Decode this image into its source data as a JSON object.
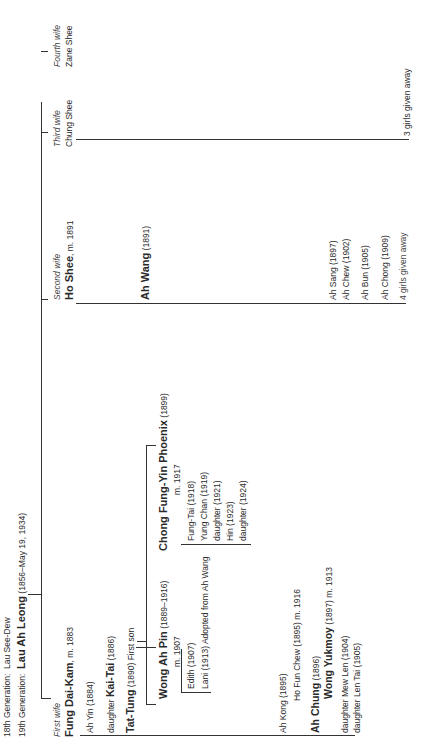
{
  "header": {
    "gen18_label": "18th Generation:",
    "gen18_name": "Lau See-Dew",
    "gen19_label": "19th Generation:",
    "gen19_name": "Lau Ah Leong",
    "gen19_dates": "(1856–May 19, 1934)"
  },
  "wives": [
    {
      "order": "First wife",
      "name": "Fung Dai-Kam",
      "note": ", m. 1883"
    },
    {
      "order": "Second wife",
      "name": "Ho Shee",
      "note": ", m. 1891"
    },
    {
      "order": "Third wife",
      "name": "Chung Shee",
      "note": ""
    },
    {
      "order": "Fourth wife",
      "name": "Zane Shee",
      "note": ""
    },
    {
      "order": "Fifth wife",
      "name": "Wong Shee",
      "note": ", m. 1903"
    }
  ],
  "first_wife_children": [
    {
      "prefix": "",
      "name": "Ah Yin",
      "bold": false,
      "note": " (1884)"
    },
    {
      "prefix": "daughter ",
      "name": "Kai-Tai",
      "bold": true,
      "note": " (1886)"
    },
    {
      "prefix": "",
      "name": "Tat-Tung",
      "bold": true,
      "note": " (1890) First son"
    },
    {
      "prefix": "",
      "name": "Ah Kong",
      "bold": false,
      "note": " (1895)"
    },
    {
      "prefix": "",
      "name": "Ah Chung",
      "bold": true,
      "note": " (1896)"
    },
    {
      "prefix": "daughter ",
      "name": "Mew Len",
      "bold": false,
      "note": " (1904)"
    },
    {
      "prefix": "daughter ",
      "name": "Len Tai",
      "bold": false,
      "note": " (1905)"
    }
  ],
  "spouses": {
    "ah_kong": "Ho Fun Chew (1895) m. 1916",
    "ah_chung_name": "Wong Yukmoy",
    "ah_chung_note": " (1897) m. 1913"
  },
  "tat_tung_wives": [
    {
      "name": "Wong Ah Pin",
      "dates": " (1889–1916)",
      "married": "m. 1907"
    },
    {
      "name": "Chong Fung-Yin Phoenix",
      "dates": " (1899)",
      "married": "m. 1917"
    }
  ],
  "wong_ah_pin_children": [
    "Edith (1907)",
    "Lani (1913) Adopted from Ah Wang"
  ],
  "chong_children": [
    "Fung-Tai (1918)",
    "Yung Chan (1919)",
    "daughter (1921)",
    "Hin (1923)",
    "daughter (1924)"
  ],
  "second_wife_children": {
    "ah_wang_name": "Ah Wang",
    "ah_wang_dates": " (1891)",
    "others": [
      "Ah Sang (1897)",
      "Ah Chew (1902)",
      "Ah Bun (1905)",
      "Ah Chong (1909)",
      "4 girls given away"
    ]
  },
  "third_wife_children": [
    "3 girls given away"
  ],
  "fifth_wife_children": [
    "Ah Chen (1904)"
  ]
}
